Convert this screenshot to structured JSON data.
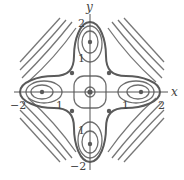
{
  "figure": {
    "type": "contour / phase portrait",
    "axis_labels": {
      "x": "x",
      "y": "y"
    },
    "x_ticks": [
      "-2",
      "-1",
      "1",
      "2"
    ],
    "y_ticks": [
      "2",
      "1",
      "-1",
      "-2"
    ],
    "colors": {
      "curve": "#6e6e6e",
      "separatrix": "#5a5a5a",
      "axis": "#555555",
      "point": "#5a5a5a"
    },
    "equilibria": [
      {
        "x": 0,
        "y": 0,
        "kind": "center"
      },
      {
        "x": 1.4,
        "y": 0,
        "kind": "center"
      },
      {
        "x": -1.4,
        "y": 0,
        "kind": "center"
      },
      {
        "x": 0,
        "y": 1.4,
        "kind": "center"
      },
      {
        "x": 0,
        "y": -1.4,
        "kind": "center"
      },
      {
        "x": 1.1,
        "y": 1.1,
        "kind": "saddle"
      },
      {
        "x": -1.1,
        "y": 1.1,
        "kind": "saddle"
      },
      {
        "x": 1.1,
        "y": -1.1,
        "kind": "saddle"
      },
      {
        "x": -1.1,
        "y": -1.1,
        "kind": "saddle"
      }
    ]
  },
  "labels": {
    "x_axis": "x",
    "y_axis": "y",
    "xm2": "−2",
    "xm1": "1",
    "xp1": "1",
    "xp2": "2",
    "yp2": "2",
    "yp1": "1",
    "ym1": "1",
    "ym2": "−2"
  }
}
